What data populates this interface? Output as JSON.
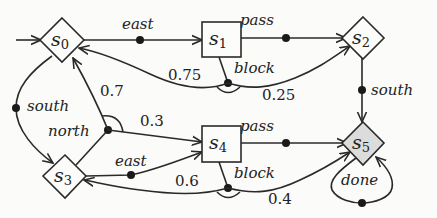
{
  "diagram": {
    "type": "MDP state-transition graph",
    "states": [
      {
        "id": "s0",
        "letter": "s",
        "index": "0",
        "shape": "diamond",
        "initial": true
      },
      {
        "id": "s1",
        "letter": "s",
        "index": "1",
        "shape": "box"
      },
      {
        "id": "s2",
        "letter": "s",
        "index": "2",
        "shape": "diamond"
      },
      {
        "id": "s3",
        "letter": "s",
        "index": "3",
        "shape": "diamond"
      },
      {
        "id": "s4",
        "letter": "s",
        "index": "4",
        "shape": "box"
      },
      {
        "id": "s5",
        "letter": "s",
        "index": "5",
        "shape": "diamond",
        "shaded": true
      }
    ],
    "actions": {
      "s0_east": "east",
      "s1_pass": "pass",
      "s1_block": "block",
      "s2_south": "south",
      "s0_south": "south",
      "s3_north": "north",
      "s3_east": "east",
      "s4_pass": "pass",
      "s4_block": "block",
      "s5_done": "done"
    },
    "probabilities": {
      "s1_block_to_s0": "0.75",
      "s1_block_to_s2": "0.25",
      "s3_north_to_s0": "0.7",
      "s3_north_to_s4": "0.3",
      "s4_block_to_s3": "0.6",
      "s4_block_to_s5": "0.4"
    },
    "colors": {
      "stroke": "#2a2a2a",
      "background": "#fbfbf9",
      "goal_fill": "#dcdcdc"
    }
  }
}
